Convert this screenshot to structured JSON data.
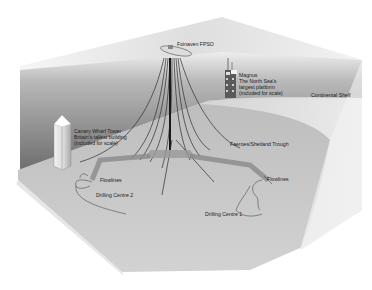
{
  "diagram": {
    "labels": {
      "fpso": "Foinaven FPSO",
      "magnus_title": "Magnus",
      "magnus_line1": "The North Sea's",
      "magnus_line2": "largest platform",
      "magnus_line3": "(included for scale)",
      "continental_shelf": "Continental Shelf",
      "canary_title": "Canary Wharf Tower",
      "canary_line1": "Britain's tallest building",
      "canary_line2": "(included for scale)",
      "trough": "Faeroes/Shetland Trough",
      "flowlines_left": "Flowlines",
      "flowlines_right": "Flowlines",
      "drilling_centre_2": "Drilling Centre 2",
      "drilling_centre_1": "Drilling Centre 1"
    },
    "colors": {
      "water_back_dark": "#7a7a7a",
      "water_back_light": "#d8d8d8",
      "seabed": "#c8c8c8",
      "shelf": "#e4e4e4",
      "top_surface": "#e6e6e6",
      "lines": "#333333"
    }
  }
}
